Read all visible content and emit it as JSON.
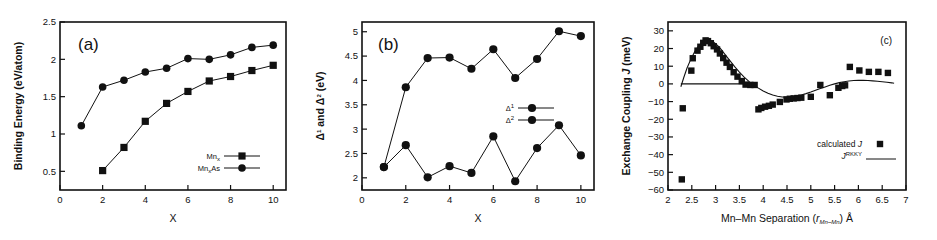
{
  "figure": {
    "panel_count": 3,
    "background_color": "#ffffff",
    "ink_color": "#111111"
  },
  "chart_data": [
    {
      "id": "panel-a",
      "type": "line",
      "title": "(a)",
      "xlabel": "X",
      "ylabel": "Binding Energy (eV/atom)",
      "xlim": [
        0,
        10.6
      ],
      "ylim": [
        0.25,
        2.5
      ],
      "xticks": [
        0,
        2,
        4,
        6,
        8,
        10
      ],
      "xticklabels": [
        "0",
        "2",
        "4",
        "6",
        "8",
        "10"
      ],
      "yticks": [
        0.5,
        1,
        1.5,
        2,
        2.5
      ],
      "yticklabels": [
        "0.5",
        "1",
        "1.5",
        "2",
        "2.5"
      ],
      "grid": false,
      "legend_position": "lower-right",
      "series": [
        {
          "name": "Mn_x",
          "label_main": "Mn",
          "label_sub": "x",
          "label_tail": "",
          "marker": "square",
          "x": [
            2,
            3,
            4,
            5,
            6,
            7,
            8,
            9,
            10
          ],
          "values": [
            0.51,
            0.82,
            1.17,
            1.41,
            1.57,
            1.71,
            1.77,
            1.85,
            1.92
          ]
        },
        {
          "name": "Mn_xAs",
          "label_main": "Mn",
          "label_sub": "x",
          "label_tail": "As",
          "marker": "circle",
          "x": [
            1,
            2,
            3,
            4,
            5,
            6,
            7,
            8,
            9,
            10
          ],
          "values": [
            1.11,
            1.63,
            1.72,
            1.83,
            1.88,
            2.01,
            2.0,
            2.06,
            2.16,
            2.19
          ]
        }
      ]
    },
    {
      "id": "panel-b",
      "type": "line",
      "title": "(b)",
      "xlabel": "X",
      "ylabel": "Δ¹ and Δ² (eV)",
      "ylabel_parts": [
        "Δ",
        "1",
        " and ",
        "Δ",
        "2",
        " (eV)"
      ],
      "xlim": [
        0,
        10.6
      ],
      "ylim": [
        1.75,
        5.2
      ],
      "xticks": [
        0,
        2,
        4,
        6,
        8,
        10
      ],
      "xticklabels": [
        "0",
        "2",
        "4",
        "6",
        "8",
        "10"
      ],
      "yticks": [
        2,
        2.5,
        3,
        3.5,
        4,
        4.5,
        5
      ],
      "yticklabels": [
        "2",
        "2.5",
        "3",
        "3.5",
        "4",
        "4.5",
        "5"
      ],
      "grid": false,
      "legend_position": "middle-right",
      "series": [
        {
          "name": "Delta1",
          "label_main": "Δ",
          "label_sup": "1",
          "marker": "circle",
          "x": [
            1,
            2,
            3,
            4,
            5,
            6,
            7,
            8,
            9,
            10
          ],
          "values": [
            2.22,
            3.86,
            4.46,
            4.47,
            4.24,
            4.64,
            4.05,
            4.44,
            5.01,
            4.91
          ]
        },
        {
          "name": "Delta2",
          "label_main": "Δ",
          "label_sup": "2",
          "marker": "circle",
          "x": [
            1,
            2,
            3,
            4,
            5,
            6,
            7,
            8,
            9,
            10
          ],
          "values": [
            2.22,
            2.67,
            2.01,
            2.24,
            2.1,
            2.85,
            1.93,
            2.61,
            3.08,
            2.46
          ]
        }
      ]
    },
    {
      "id": "panel-c",
      "type": "scatter",
      "title": "(c)",
      "xlabel": "Mn–Mn Separation (r_Mn–Mn) Å",
      "xlabel_parts": [
        "Mn–Mn Separation (",
        "r",
        "Mn–Mn",
        ") Å"
      ],
      "ylabel": "Exchange Coupling J (meV)",
      "ylabel_parts": [
        "Exchange Coupling ",
        "J",
        " (meV)"
      ],
      "xlim": [
        2,
        7
      ],
      "ylim": [
        -60,
        35
      ],
      "xticks": [
        2,
        2.5,
        3,
        3.5,
        4,
        4.5,
        5,
        5.5,
        6,
        6.5,
        7
      ],
      "xticklabels": [
        "2",
        "2.5",
        "3",
        "3.5",
        "4",
        "4.5",
        "5",
        "5.5",
        "6",
        "6.5",
        "7"
      ],
      "yticks": [
        -60,
        -50,
        -40,
        -30,
        -20,
        -10,
        0,
        10,
        20,
        30
      ],
      "yticklabels": [
        "−60",
        "−50",
        "−40",
        "−30",
        "−20",
        "−10",
        "0",
        "10",
        "20",
        "30"
      ],
      "grid": false,
      "legend_position": "lower-right",
      "series": [
        {
          "name": "calculated J",
          "label_main": "calculated ",
          "label_italic": "J",
          "marker": "square",
          "points": [
            [
              2.29,
              -54.0
            ],
            [
              2.31,
              -13.8
            ],
            [
              2.49,
              7.5
            ],
            [
              2.52,
              14.5
            ],
            [
              2.62,
              18.8
            ],
            [
              2.68,
              21.0
            ],
            [
              2.74,
              23.2
            ],
            [
              2.79,
              24.6
            ],
            [
              2.84,
              24.2
            ],
            [
              2.9,
              23.0
            ],
            [
              2.96,
              21.3
            ],
            [
              3.03,
              19.5
            ],
            [
              3.09,
              17.2
            ],
            [
              3.16,
              14.6
            ],
            [
              3.23,
              12.0
            ],
            [
              3.3,
              9.6
            ],
            [
              3.38,
              6.6
            ],
            [
              3.46,
              4.1
            ],
            [
              3.55,
              1.6
            ],
            [
              3.63,
              -0.4
            ],
            [
              3.73,
              -0.6
            ],
            [
              3.82,
              -0.6
            ],
            [
              3.9,
              -14.4
            ],
            [
              3.96,
              -13.6
            ],
            [
              4.04,
              -12.9
            ],
            [
              4.12,
              -12.4
            ],
            [
              4.2,
              -11.7
            ],
            [
              4.35,
              -10.2
            ],
            [
              4.49,
              -8.8
            ],
            [
              4.56,
              -8.4
            ],
            [
              4.64,
              -8.2
            ],
            [
              4.72,
              -8.0
            ],
            [
              4.8,
              -7.8
            ],
            [
              5.0,
              -7.3
            ],
            [
              5.2,
              -0.6
            ],
            [
              5.4,
              -6.4
            ],
            [
              5.58,
              -2.2
            ],
            [
              5.66,
              -1.2
            ],
            [
              5.72,
              -0.8
            ],
            [
              5.82,
              9.6
            ],
            [
              6.02,
              7.6
            ],
            [
              6.22,
              6.8
            ],
            [
              6.42,
              6.8
            ],
            [
              6.62,
              6.2
            ]
          ]
        },
        {
          "name": "J_RKKY",
          "label_main": "J",
          "label_sup": "RKKY",
          "marker": "line",
          "curve": [
            [
              2.27,
              -1.6
            ],
            [
              2.33,
              3.5
            ],
            [
              2.4,
              9.0
            ],
            [
              2.48,
              14.0
            ],
            [
              2.56,
              18.2
            ],
            [
              2.64,
              21.4
            ],
            [
              2.72,
              23.6
            ],
            [
              2.8,
              24.7
            ],
            [
              2.88,
              24.6
            ],
            [
              2.96,
              23.6
            ],
            [
              3.04,
              21.8
            ],
            [
              3.12,
              19.4
            ],
            [
              3.2,
              16.6
            ],
            [
              3.3,
              13.2
            ],
            [
              3.4,
              9.8
            ],
            [
              3.5,
              6.6
            ],
            [
              3.6,
              3.8
            ],
            [
              3.7,
              1.4
            ],
            [
              3.8,
              -0.6
            ],
            [
              3.9,
              -2.4
            ],
            [
              4.0,
              -4.0
            ],
            [
              4.1,
              -5.3
            ],
            [
              4.2,
              -6.3
            ],
            [
              4.3,
              -7.0
            ],
            [
              4.4,
              -7.4
            ],
            [
              4.5,
              -7.5
            ],
            [
              4.6,
              -7.3
            ],
            [
              4.7,
              -6.9
            ],
            [
              4.8,
              -6.3
            ],
            [
              4.9,
              -5.5
            ],
            [
              5.0,
              -4.6
            ],
            [
              5.1,
              -3.6
            ],
            [
              5.2,
              -2.6
            ],
            [
              5.3,
              -1.7
            ],
            [
              5.4,
              -0.8
            ],
            [
              5.5,
              0.0
            ],
            [
              5.6,
              0.7
            ],
            [
              5.7,
              1.2
            ],
            [
              5.8,
              1.6
            ],
            [
              5.9,
              1.9
            ],
            [
              6.0,
              2.0
            ],
            [
              6.1,
              2.0
            ],
            [
              6.2,
              1.9
            ],
            [
              6.3,
              1.7
            ],
            [
              6.4,
              1.5
            ],
            [
              6.5,
              1.2
            ],
            [
              6.6,
              0.9
            ],
            [
              6.7,
              0.6
            ],
            [
              6.75,
              0.4
            ]
          ]
        }
      ],
      "zero_line": 0
    }
  ]
}
